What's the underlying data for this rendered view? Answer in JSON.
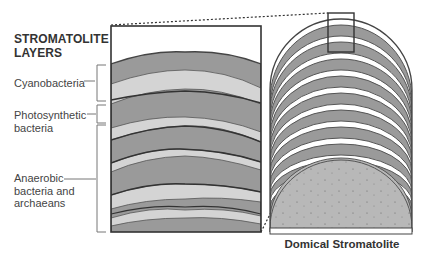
{
  "diagram": {
    "title_line1": "STROMATOLITE",
    "title_line2": "LAYERS",
    "labels": [
      {
        "name": "cyanobacteria",
        "line1": "Cyanobacteria",
        "line2": ""
      },
      {
        "name": "photosynthetic-bacteria",
        "line1": "Photosynthetic",
        "line2": "bacteria"
      },
      {
        "name": "anaerobic",
        "line1": "Anaerobic",
        "line2": "bacteria and",
        "line3": "archaeans"
      }
    ],
    "caption": "Domical Stromatolite",
    "colors": {
      "dark_layer": "#9a9a9a",
      "light_layer": "#d4d4d4",
      "outline": "#444444",
      "core_fill": "#b5b5b5"
    }
  }
}
